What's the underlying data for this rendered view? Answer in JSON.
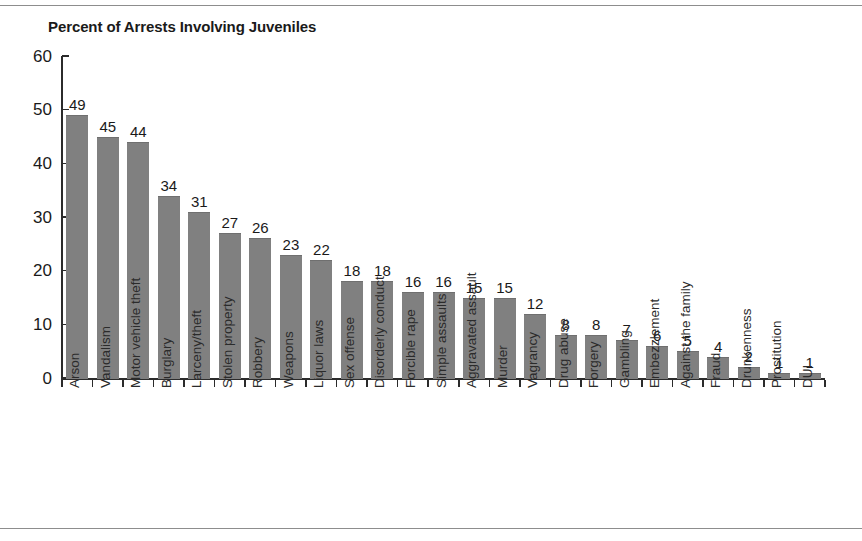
{
  "chart_data": {
    "type": "bar",
    "title": "Percent of Arrests Involving Juveniles",
    "xlabel": "",
    "ylabel": "",
    "ylim": [
      0,
      60
    ],
    "yticks": [
      0,
      10,
      20,
      30,
      40,
      50,
      60
    ],
    "grid": false,
    "legend": "none",
    "orientation": "vertical",
    "bar_color": "#808080",
    "categories": [
      "Arson",
      "Vandalism",
      "Motor vehicle theft",
      "Burglary",
      "Larceny/theft",
      "Stolen property",
      "Robbery",
      "Weapons",
      "Liquor laws",
      "Sex offense",
      "Disorderly conduct",
      "Forcible rape",
      "Simple assaults",
      "Aggravated assault",
      "Murder",
      "Vagrancy",
      "Drug abuse",
      "Forgery",
      "Gambling",
      "Embezzlement",
      "Against the family",
      "Fraud",
      "Drunkenness",
      "Prostitution",
      "DUI"
    ],
    "values": [
      49,
      45,
      44,
      34,
      31,
      27,
      26,
      23,
      22,
      18,
      18,
      16,
      16,
      15,
      15,
      12,
      8,
      8,
      7,
      6,
      5,
      4,
      2,
      1,
      1
    ]
  }
}
